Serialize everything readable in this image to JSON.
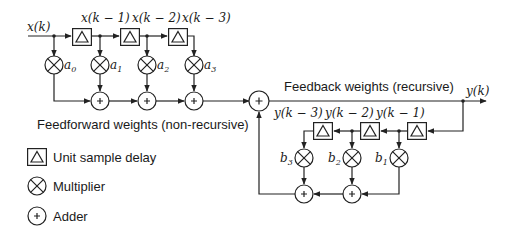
{
  "diagram": {
    "input_label": "x(k)",
    "output_label": "y(k)",
    "feedforward": {
      "caption": "Feedforward weights (non-recursive)",
      "delay_labels": [
        "x(k − 1)",
        "x(k − 2)",
        "x(k − 3)"
      ],
      "weights": [
        {
          "base": "a",
          "sub": "0"
        },
        {
          "base": "a",
          "sub": "1"
        },
        {
          "base": "a",
          "sub": "2"
        },
        {
          "base": "a",
          "sub": "3"
        }
      ]
    },
    "feedback": {
      "caption": "Feedback weights (recursive)",
      "delay_labels": [
        "y(k − 3)",
        "y(k − 2)",
        "y(k − 1)"
      ],
      "weights": [
        {
          "base": "b",
          "sub": "3"
        },
        {
          "base": "b",
          "sub": "2"
        },
        {
          "base": "b",
          "sub": "1"
        }
      ]
    },
    "legend": [
      {
        "symbol": "delay-box",
        "label": "Unit sample delay"
      },
      {
        "symbol": "multiplier",
        "label": "Multiplier"
      },
      {
        "symbol": "adder",
        "label": "Adder"
      }
    ],
    "colors": {
      "line": "#222222",
      "background": "#ffffff"
    }
  }
}
